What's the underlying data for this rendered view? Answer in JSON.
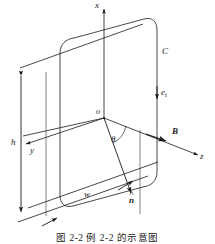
{
  "figure": {
    "caption": "图 2-2  例 2-2 的示意图",
    "line_color": "#1a1a1a",
    "background": "#ffffff"
  },
  "axes": [
    {
      "id": "x",
      "label": "x",
      "description": "vertical axis pointing up"
    },
    {
      "id": "y",
      "label": "y",
      "description": "axis pointing down-left toward viewer"
    },
    {
      "id": "z",
      "label": "z",
      "description": "axis pointing down-right"
    }
  ],
  "labels": {
    "origin": "o",
    "angle": "θ",
    "loop": "C",
    "current_direction": "e",
    "current_direction_sub": "i",
    "magnetic_field": "B",
    "normal": "n",
    "height": "h",
    "width": "w"
  },
  "annotations": [
    {
      "name": "x-axis-label",
      "text": "x"
    },
    {
      "name": "y-axis-label",
      "text": "y"
    },
    {
      "name": "z-axis-label",
      "text": "z"
    },
    {
      "name": "origin-label",
      "text": "o"
    },
    {
      "name": "theta-label",
      "text": "θ"
    },
    {
      "name": "curve-label",
      "text": "C"
    },
    {
      "name": "unit-vector-ei-label",
      "text": "ei"
    },
    {
      "name": "magnetic-field-label",
      "text": "B"
    },
    {
      "name": "normal-vector-label",
      "text": "n̂"
    },
    {
      "name": "height-dimension-label",
      "text": "h"
    },
    {
      "name": "width-dimension-label",
      "text": "w"
    }
  ]
}
